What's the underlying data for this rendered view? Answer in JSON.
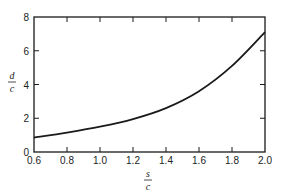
{
  "chart_data": {
    "type": "line",
    "title": "",
    "xlabel": "s/c",
    "ylabel": "d/c",
    "xlabel_parts": {
      "numerator": "s",
      "denominator": "c"
    },
    "ylabel_parts": {
      "numerator": "d",
      "denominator": "c"
    },
    "xlim": [
      0.6,
      2.0
    ],
    "ylim": [
      0,
      8
    ],
    "x_ticks": [
      0.6,
      0.8,
      1.0,
      1.2,
      1.4,
      1.6,
      1.8,
      2.0
    ],
    "x_tick_labels": [
      "0.6",
      "0.8",
      "1.0",
      "1.2",
      "1.4",
      "1.6",
      "1.8",
      "2.0"
    ],
    "y_ticks": [
      0,
      2,
      4,
      6,
      8
    ],
    "y_tick_labels": [
      "0",
      "2",
      "4",
      "6",
      "8"
    ],
    "grid": false,
    "legend": null,
    "series": [
      {
        "name": "d/c vs s/c",
        "x": [
          0.6,
          0.8,
          1.0,
          1.2,
          1.4,
          1.6,
          1.8,
          2.0
        ],
        "values": [
          0.85,
          1.15,
          1.5,
          1.95,
          2.6,
          3.6,
          5.1,
          7.1
        ]
      }
    ],
    "colors": {
      "line": "#1a1a1a",
      "axis": "#1a1a1a",
      "background": "#ffffff"
    }
  }
}
